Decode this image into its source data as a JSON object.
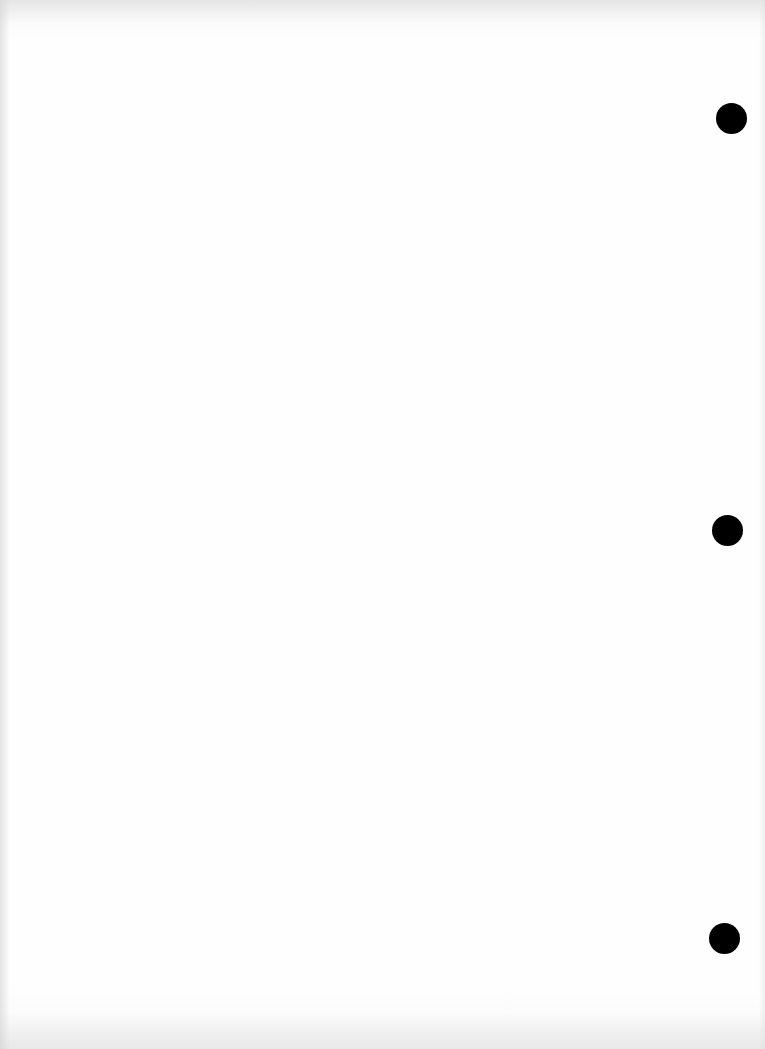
{
  "document": {
    "type": "blank scanned page",
    "background_color": "#fefefe",
    "text_content": [],
    "punch_holes": [
      {
        "cx": 731,
        "cy": 118,
        "diameter": 31,
        "color": "#000000"
      },
      {
        "cx": 727,
        "cy": 530,
        "diameter": 31,
        "color": "#000000"
      },
      {
        "cx": 724,
        "cy": 938,
        "diameter": 31,
        "color": "#000000"
      }
    ]
  }
}
